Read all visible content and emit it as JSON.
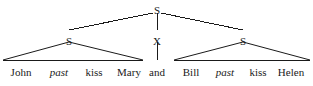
{
  "figure": {
    "type": "syntax-tree-diagram",
    "ink_color": "#1a1a1a",
    "background_color": "#ffffff",
    "width": 313,
    "height": 86
  },
  "nodes": {
    "root": {
      "label": "S",
      "x": 157,
      "y": 5
    },
    "left_s": {
      "label": "S",
      "x": 69,
      "y": 36
    },
    "coord_x": {
      "label": "X",
      "x": 157,
      "y": 36
    },
    "right_s": {
      "label": "S",
      "x": 243,
      "y": 36
    }
  },
  "terminals": [
    {
      "label": "John",
      "x": 21,
      "y": 66,
      "italic": false,
      "parent": "left_s"
    },
    {
      "label": "past",
      "x": 59,
      "y": 66,
      "italic": true,
      "parent": "left_s"
    },
    {
      "label": "kiss",
      "x": 94,
      "y": 66,
      "italic": false,
      "parent": "left_s"
    },
    {
      "label": "Mary",
      "x": 129,
      "y": 66,
      "italic": false,
      "parent": "left_s"
    },
    {
      "label": "and",
      "x": 157,
      "y": 66,
      "italic": false,
      "parent": "coord_x"
    },
    {
      "label": "Bill",
      "x": 191,
      "y": 66,
      "italic": false,
      "parent": "right_s"
    },
    {
      "label": "past",
      "x": 225,
      "y": 66,
      "italic": true,
      "parent": "right_s"
    },
    {
      "label": "kiss",
      "x": 258,
      "y": 66,
      "italic": false,
      "parent": "right_s"
    },
    {
      "label": "Helen",
      "x": 291,
      "y": 66,
      "italic": false,
      "parent": "right_s"
    }
  ],
  "edges": [
    {
      "name": "root-to-left-s",
      "from": "root",
      "to": "left_s"
    },
    {
      "name": "root-to-x",
      "from": "root",
      "to": "coord_x"
    },
    {
      "name": "root-to-right-s",
      "from": "root",
      "to": "right_s"
    },
    {
      "name": "x-to-and",
      "from": "coord_x",
      "to": "and"
    }
  ],
  "triangles": [
    {
      "name": "left-conjunct-triangle",
      "apex_x": 69,
      "apex_y": 42,
      "left_x": 3,
      "right_x": 143,
      "base_y": 60
    },
    {
      "name": "right-conjunct-triangle",
      "apex_x": 243,
      "apex_y": 42,
      "left_x": 174,
      "right_x": 310,
      "base_y": 60
    }
  ]
}
